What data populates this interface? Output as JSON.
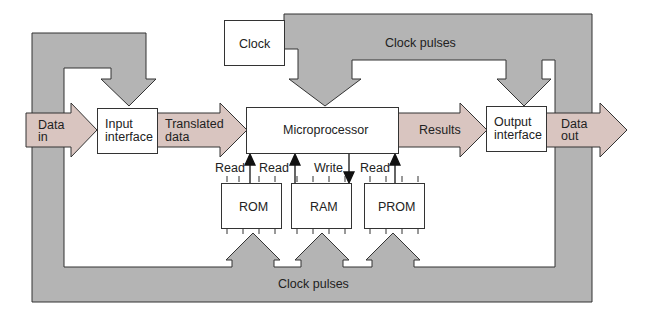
{
  "diagram": {
    "colors": {
      "bus_fill": "#b4b4b4",
      "bus_stroke": "#333333",
      "data_fill": "#d9c5c0",
      "box_fill": "#ffffff"
    },
    "blocks": {
      "clock": "Clock",
      "input_interface": [
        "Input",
        "interface"
      ],
      "microprocessor": "Microprocessor",
      "output_interface": [
        "Output",
        "interface"
      ],
      "rom": "ROM",
      "ram": "RAM",
      "prom": "PROM"
    },
    "data_arrows": {
      "data_in": [
        "Data",
        "in"
      ],
      "translated_data": [
        "Translated",
        "data"
      ],
      "results": "Results",
      "data_out": [
        "Data",
        "out"
      ]
    },
    "bus_labels": {
      "top": "Clock pulses",
      "bottom": "Clock pulses"
    },
    "memory_signals": {
      "rom": "Read",
      "ram_read": "Read",
      "ram_write": "Write",
      "prom": "Read"
    }
  }
}
